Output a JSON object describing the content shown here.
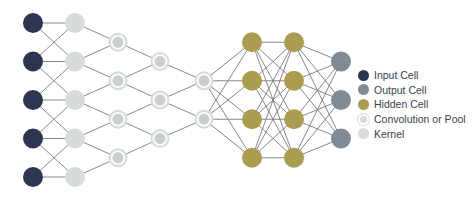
{
  "colors": {
    "input": "#2d3550",
    "output": "#808b96",
    "hidden": "#ab9d4f",
    "conv": "#d7dcdb",
    "kernel": "#d7dcdb",
    "edge": "#7b7b7b"
  },
  "layers": [
    {
      "name": "input",
      "type": "input",
      "count": 5
    },
    {
      "name": "kernel",
      "type": "kernel",
      "count": 5
    },
    {
      "name": "conv1",
      "type": "conv",
      "count": 4
    },
    {
      "name": "conv2",
      "type": "conv",
      "count": 3
    },
    {
      "name": "conv3",
      "type": "conv",
      "count": 2
    },
    {
      "name": "hidden1",
      "type": "hidden",
      "count": 4
    },
    {
      "name": "hidden2",
      "type": "hidden",
      "count": 4
    },
    {
      "name": "output",
      "type": "output",
      "count": 3
    }
  ],
  "connections": [
    {
      "from": 0,
      "to": 1,
      "pattern": "local"
    },
    {
      "from": 1,
      "to": 2,
      "pattern": "pairs"
    },
    {
      "from": 2,
      "to": 3,
      "pattern": "pairs"
    },
    {
      "from": 3,
      "to": 4,
      "pattern": "pairs"
    },
    {
      "from": 4,
      "to": 5,
      "pattern": "full"
    },
    {
      "from": 5,
      "to": 6,
      "pattern": "full"
    },
    {
      "from": 6,
      "to": 7,
      "pattern": "full"
    }
  ],
  "legend": [
    {
      "type": "input",
      "label": "Input Cell"
    },
    {
      "type": "output",
      "label": "Output Cell"
    },
    {
      "type": "hidden",
      "label": "Hidden Cell"
    },
    {
      "type": "conv",
      "label": "Convolution or Pool"
    },
    {
      "type": "kernel",
      "label": "Kernel"
    }
  ]
}
